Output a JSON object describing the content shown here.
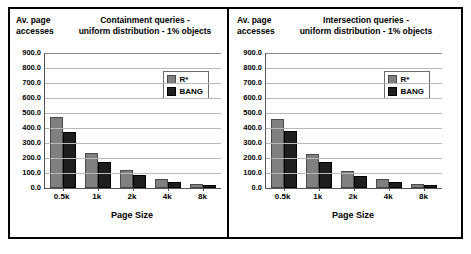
{
  "figure": {
    "background": "#ffffff",
    "frame_color": "#000000",
    "series_colors": [
      "#808080",
      "#1e1e1e"
    ]
  },
  "panels": [
    {
      "name": "containment",
      "y_axis_caption": "Av. page\naccesses",
      "y_axis_caption_line1": "Av. page",
      "y_axis_caption_line2": "accesses",
      "title_line1": "Containment queries -",
      "title_line2": "uniform distribution -  1% objects",
      "legend": {
        "position": "upper-right-inside",
        "entries": [
          "R*",
          "BANG"
        ]
      },
      "chart_data": {
        "type": "bar",
        "title": "Containment queries - uniform distribution -  1% objects",
        "xlabel": "Page Size",
        "ylabel": "Av. page accesses",
        "categories": [
          "0.5k",
          "1k",
          "2k",
          "4k",
          "8k"
        ],
        "series": [
          {
            "name": "R*",
            "values": [
              473,
              233,
              120,
              60,
              28
            ]
          },
          {
            "name": "BANG",
            "values": [
              373,
              173,
              87,
              40,
              20
            ]
          }
        ],
        "ylim": [
          0,
          900
        ],
        "yticks": [
          0,
          100,
          200,
          300,
          400,
          500,
          600,
          700,
          800,
          900
        ],
        "ytick_labels": [
          "0.0",
          "100.0",
          "200.0",
          "300.0",
          "400.0",
          "500.0",
          "600.0",
          "700.0",
          "800.0",
          "900.0"
        ],
        "grid": true,
        "legend_position": "upper right"
      }
    },
    {
      "name": "intersection",
      "y_axis_caption_line1": "Av. page",
      "y_axis_caption_line2": "accesses",
      "title_line1": "Intersection queries -",
      "title_line2": "uniform distribution -  1% objects",
      "legend": {
        "position": "upper-right-inside",
        "entries": [
          "R*",
          "BANG"
        ]
      },
      "chart_data": {
        "type": "bar",
        "title": "Intersection queries - uniform distribution -  1% objects",
        "xlabel": "Page Size",
        "ylabel": "Av. page accesses",
        "categories": [
          "0.5k",
          "1k",
          "2k",
          "4k",
          "8k"
        ],
        "series": [
          {
            "name": "R*",
            "values": [
              462,
              230,
              115,
              58,
              26
            ]
          },
          {
            "name": "BANG",
            "values": [
              380,
              172,
              83,
              40,
              17
            ]
          }
        ],
        "ylim": [
          0,
          900
        ],
        "yticks": [
          0,
          100,
          200,
          300,
          400,
          500,
          600,
          700,
          800,
          900
        ],
        "ytick_labels": [
          "0.0",
          "100.0",
          "200.0",
          "300.0",
          "400.0",
          "500.0",
          "600.0",
          "700.0",
          "800.0",
          "900.0"
        ],
        "grid": true,
        "legend_position": "upper right"
      }
    }
  ]
}
